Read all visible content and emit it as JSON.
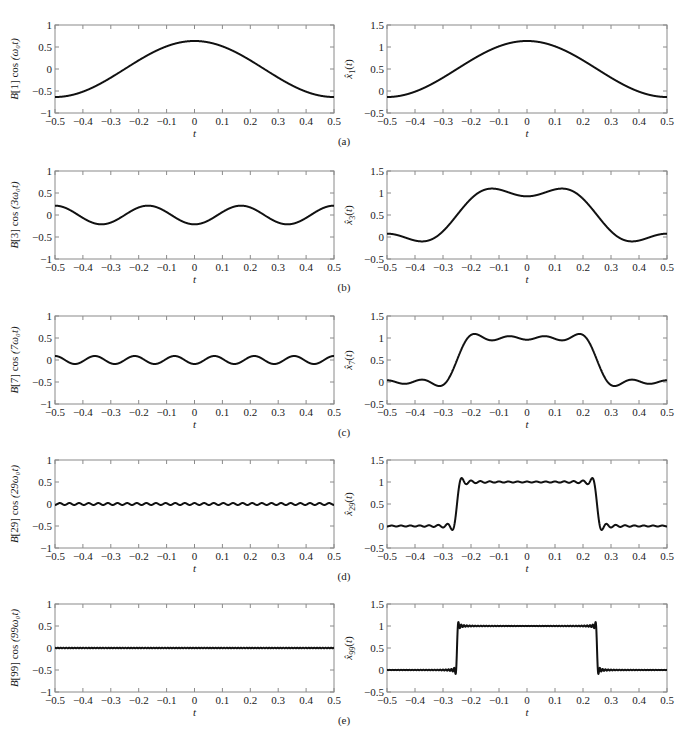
{
  "chart_data": [
    {
      "panel": "(a)",
      "position": "left",
      "type": "line",
      "ylabel": "B[1] cos (ω₀t)",
      "xlabel": "t",
      "xlim": [
        -0.5,
        0.5
      ],
      "ylim": [
        -1,
        1
      ],
      "xticks": [
        -0.5,
        -0.4,
        -0.3,
        -0.2,
        -0.1,
        0,
        0.1,
        0.2,
        0.3,
        0.4,
        0.5
      ],
      "yticks": [
        -1,
        -0.5,
        0,
        0.5,
        1
      ],
      "series": [
        {
          "name": "B[1] cos(ω0 t)",
          "kind": "harmonic",
          "k": 1,
          "amplitude": 0.637,
          "x": [
            -0.5,
            -0.4,
            -0.3,
            -0.2,
            -0.1,
            0,
            0.1,
            0.2,
            0.3,
            0.4,
            0.5
          ],
          "values": [
            -0.64,
            -0.52,
            -0.2,
            0.2,
            0.52,
            0.64,
            0.52,
            0.2,
            -0.2,
            -0.52,
            -0.64
          ]
        }
      ]
    },
    {
      "panel": "(a)",
      "position": "right",
      "type": "line",
      "ylabel": "x̂₁(t)",
      "xlabel": "t",
      "xlim": [
        -0.5,
        0.5
      ],
      "ylim": [
        -0.5,
        1.5
      ],
      "xticks": [
        -0.5,
        -0.4,
        -0.3,
        -0.2,
        -0.1,
        0,
        0.1,
        0.2,
        0.3,
        0.4,
        0.5
      ],
      "yticks": [
        -0.5,
        0,
        0.5,
        1,
        1.5
      ],
      "series": [
        {
          "name": "x̂1(t)",
          "kind": "partial_sum",
          "N": 1,
          "x": [
            -0.5,
            -0.4,
            -0.3,
            -0.2,
            -0.1,
            0,
            0.1,
            0.2,
            0.3,
            0.4,
            0.5
          ],
          "values": [
            -0.14,
            -0.02,
            0.3,
            0.7,
            1.02,
            1.14,
            1.02,
            0.7,
            0.3,
            -0.02,
            -0.14
          ]
        }
      ]
    },
    {
      "panel": "(b)",
      "position": "left",
      "type": "line",
      "ylabel": "B[3] cos (3ω₀t)",
      "xlabel": "t",
      "xlim": [
        -0.5,
        0.5
      ],
      "ylim": [
        -1,
        1
      ],
      "xticks": [
        -0.5,
        -0.4,
        -0.3,
        -0.2,
        -0.1,
        0,
        0.1,
        0.2,
        0.3,
        0.4,
        0.5
      ],
      "yticks": [
        -1,
        -0.5,
        0,
        0.5,
        1
      ],
      "series": [
        {
          "name": "B[3] cos(3ω0 t)",
          "kind": "harmonic",
          "k": 3,
          "amplitude": -0.212,
          "x": [
            -0.5,
            -0.333,
            -0.167,
            0,
            0.167,
            0.333,
            0.5
          ],
          "values": [
            0.21,
            -0.21,
            0.21,
            -0.21,
            0.21,
            -0.21,
            0.21
          ]
        }
      ]
    },
    {
      "panel": "(b)",
      "position": "right",
      "type": "line",
      "ylabel": "x̂₃(t)",
      "xlabel": "t",
      "xlim": [
        -0.5,
        0.5
      ],
      "ylim": [
        -0.5,
        1.5
      ],
      "xticks": [
        -0.5,
        -0.4,
        -0.3,
        -0.2,
        -0.1,
        0,
        0.1,
        0.2,
        0.3,
        0.4,
        0.5
      ],
      "yticks": [
        -0.5,
        0,
        0.5,
        1,
        1.5
      ],
      "series": [
        {
          "name": "x̂3(t)",
          "kind": "partial_sum",
          "N": 3,
          "x": [
            -0.5,
            -0.37,
            -0.25,
            -0.13,
            0,
            0.13,
            0.25,
            0.37,
            0.5
          ],
          "values": [
            0.07,
            -0.1,
            0.5,
            1.1,
            0.93,
            1.1,
            0.5,
            -0.1,
            0.07
          ]
        }
      ]
    },
    {
      "panel": "(c)",
      "position": "left",
      "type": "line",
      "ylabel": "B[7] cos (7ω₀t)",
      "xlabel": "t",
      "xlim": [
        -0.5,
        0.5
      ],
      "ylim": [
        -1,
        1
      ],
      "xticks": [
        -0.5,
        -0.4,
        -0.3,
        -0.2,
        -0.1,
        0,
        0.1,
        0.2,
        0.3,
        0.4,
        0.5
      ],
      "yticks": [
        -1,
        -0.5,
        0,
        0.5,
        1
      ],
      "series": [
        {
          "name": "B[7] cos(7ω0 t)",
          "kind": "harmonic",
          "k": 7,
          "amplitude": -0.091,
          "x": [
            -0.5,
            -0.429,
            -0.357,
            -0.286,
            -0.214,
            -0.143,
            -0.071,
            0,
            0.071,
            0.143,
            0.214,
            0.286,
            0.357,
            0.429,
            0.5
          ],
          "values": [
            0.09,
            -0.09,
            0.09,
            -0.09,
            0.09,
            -0.09,
            0.09,
            -0.09,
            0.09,
            -0.09,
            0.09,
            -0.09,
            0.09,
            -0.09,
            0.09
          ]
        }
      ]
    },
    {
      "panel": "(c)",
      "position": "right",
      "type": "line",
      "ylabel": "x̂₇(t)",
      "xlabel": "t",
      "xlim": [
        -0.5,
        0.5
      ],
      "ylim": [
        -0.5,
        1.5
      ],
      "xticks": [
        -0.5,
        -0.4,
        -0.3,
        -0.2,
        -0.1,
        0,
        0.1,
        0.2,
        0.3,
        0.4,
        0.5
      ],
      "yticks": [
        -0.5,
        0,
        0.5,
        1,
        1.5
      ],
      "series": [
        {
          "name": "x̂7(t)",
          "kind": "partial_sum",
          "N": 7,
          "x": [
            -0.5,
            -0.44,
            -0.38,
            -0.31,
            -0.25,
            -0.19,
            -0.12,
            -0.06,
            0,
            0.06,
            0.12,
            0.19,
            0.25,
            0.31,
            0.38,
            0.44,
            0.5
          ],
          "values": [
            0.04,
            -0.06,
            0.04,
            -0.12,
            0.5,
            1.12,
            0.94,
            1.05,
            0.96,
            1.05,
            0.94,
            1.12,
            0.5,
            -0.12,
            0.04,
            -0.06,
            0.04
          ]
        }
      ]
    },
    {
      "panel": "(d)",
      "position": "left",
      "type": "line",
      "ylabel": "B[29] cos (29ω₀t)",
      "xlabel": "t",
      "xlim": [
        -0.5,
        0.5
      ],
      "ylim": [
        -1,
        1
      ],
      "xticks": [
        -0.5,
        -0.4,
        -0.3,
        -0.2,
        -0.1,
        0,
        0.1,
        0.2,
        0.3,
        0.4,
        0.5
      ],
      "yticks": [
        -1,
        -0.5,
        0,
        0.5,
        1
      ],
      "series": [
        {
          "name": "B[29] cos(29ω0 t)",
          "kind": "harmonic",
          "k": 29,
          "amplitude": 0.022,
          "x": [
            -0.5,
            0,
            0.5
          ],
          "values": [
            -0.02,
            0.02,
            -0.02
          ]
        }
      ]
    },
    {
      "panel": "(d)",
      "position": "right",
      "type": "line",
      "ylabel": "x̂₂₉(t)",
      "xlabel": "t",
      "xlim": [
        -0.5,
        0.5
      ],
      "ylim": [
        -0.5,
        1.5
      ],
      "xticks": [
        -0.5,
        -0.4,
        -0.3,
        -0.2,
        -0.1,
        0,
        0.1,
        0.2,
        0.3,
        0.4,
        0.5
      ],
      "yticks": [
        -0.5,
        0,
        0.5,
        1,
        1.5
      ],
      "series": [
        {
          "name": "x̂29(t)",
          "kind": "partial_sum",
          "N": 29,
          "x": [
            -0.5,
            -0.27,
            -0.25,
            -0.23,
            0,
            0.23,
            0.25,
            0.27,
            0.5
          ],
          "values": [
            0.0,
            -0.09,
            0.5,
            1.09,
            1.0,
            1.09,
            0.5,
            -0.09,
            0.0
          ]
        }
      ]
    },
    {
      "panel": "(e)",
      "position": "left",
      "type": "line",
      "ylabel": "B[99] cos (99ω₀t)",
      "xlabel": "t",
      "xlim": [
        -0.5,
        0.5
      ],
      "ylim": [
        -1,
        1
      ],
      "xticks": [
        -0.5,
        -0.4,
        -0.3,
        -0.2,
        -0.1,
        0,
        0.1,
        0.2,
        0.3,
        0.4,
        0.5
      ],
      "yticks": [
        -1,
        -0.5,
        0,
        0.5,
        1
      ],
      "series": [
        {
          "name": "B[99] cos(99ω0 t)",
          "kind": "harmonic",
          "k": 99,
          "amplitude": -0.0064,
          "x": [
            -0.5,
            0,
            0.5
          ],
          "values": [
            0.006,
            -0.006,
            0.006
          ]
        }
      ]
    },
    {
      "panel": "(e)",
      "position": "right",
      "type": "line",
      "ylabel": "x̂₉₉(t)",
      "xlabel": "t",
      "xlim": [
        -0.5,
        0.5
      ],
      "ylim": [
        -0.5,
        1.5
      ],
      "xticks": [
        -0.5,
        -0.4,
        -0.3,
        -0.2,
        -0.1,
        0,
        0.1,
        0.2,
        0.3,
        0.4,
        0.5
      ],
      "yticks": [
        -0.5,
        0,
        0.5,
        1,
        1.5
      ],
      "series": [
        {
          "name": "x̂99(t)",
          "kind": "partial_sum",
          "N": 99,
          "x": [
            -0.5,
            -0.255,
            -0.25,
            -0.245,
            0,
            0.245,
            0.25,
            0.255,
            0.5
          ],
          "values": [
            0.0,
            -0.09,
            0.5,
            1.09,
            1.0,
            1.09,
            0.5,
            -0.09,
            0.0
          ]
        }
      ]
    }
  ],
  "panels": [
    {
      "label": "(a)",
      "k": 1,
      "left_ylabel": {
        "coef": "B[1]",
        "arg": "(ω₀t)"
      },
      "right_ylabel": {
        "sub": "1"
      }
    },
    {
      "label": "(b)",
      "k": 3,
      "left_ylabel": {
        "coef": "B[3]",
        "arg": "(3ω₀t)"
      },
      "right_ylabel": {
        "sub": "3"
      }
    },
    {
      "label": "(c)",
      "k": 7,
      "left_ylabel": {
        "coef": "B[7]",
        "arg": "(7ω₀t)"
      },
      "right_ylabel": {
        "sub": "7"
      }
    },
    {
      "label": "(d)",
      "k": 29,
      "left_ylabel": {
        "coef": "B[29]",
        "arg": "(29ω₀t)"
      },
      "right_ylabel": {
        "sub": "29"
      }
    },
    {
      "label": "(e)",
      "k": 99,
      "left_ylabel": {
        "coef": "B[99]",
        "arg": "(99ω₀t)"
      },
      "right_ylabel": {
        "sub": "99"
      }
    }
  ],
  "axes": {
    "xlabel": "t",
    "xtick_labels": [
      "−0.5",
      "−0.4",
      "−0.3",
      "−0.2",
      "−0.1",
      "0",
      "0.1",
      "0.2",
      "0.3",
      "0.4",
      "0.5"
    ],
    "left_ytick_labels": [
      "−1",
      "−0.5",
      "0",
      "0.5",
      "1"
    ],
    "right_ytick_labels": [
      "−0.5",
      "0",
      "0.5",
      "1",
      "1.5"
    ]
  },
  "style": {
    "line_color": "#111111",
    "frame_color": "#8a8a8a",
    "background": "#ffffff"
  }
}
